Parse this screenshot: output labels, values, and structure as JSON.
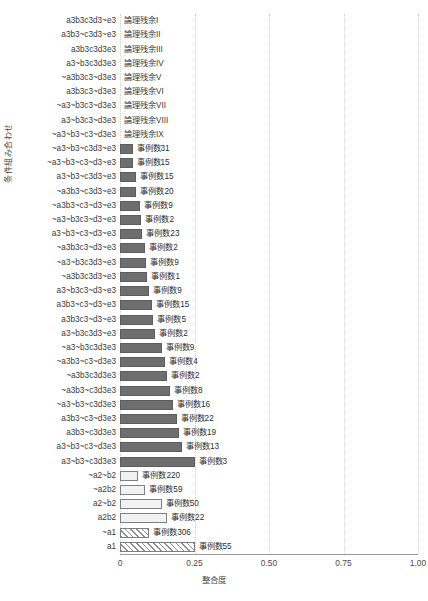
{
  "chart_data": {
    "type": "bar",
    "title": "",
    "xlabel": "整合度",
    "ylabel": "条件組み合わせ",
    "xlim": [
      0,
      1.0
    ],
    "xticks": [
      "0",
      "0.25",
      "0.50",
      "0.75",
      "1.00"
    ],
    "xtick_values": [
      0,
      0.25,
      0.5,
      0.75,
      1.0
    ],
    "grid": "vertical-dotted",
    "legend": "none",
    "orientation": "horizontal",
    "bar_styles": {
      "solid": "#6e6e6e",
      "hollow": "#f2f2f2",
      "hatch": "diagonal-stripes"
    },
    "categories": [
      "a3b3c3d3~e3",
      "a3b3~c3d3~e3",
      "a3b3c3d3e3",
      "a3~b3c3d3e3",
      "~a3b3c3~d3e3",
      "a3b3c3~d3e3",
      "~a3~b3c3~d3e3",
      "a3~b3c3~d3e3",
      "~a3~b3~c3~d3e3",
      "~a3~b3~c3d3~e3",
      "~a3~b3~c3~d3~e3",
      "a3~b3~c3d3~e3",
      "~a3b3~c3d3~e3",
      "~a3b3~c3~d3~e3",
      "~a3~b3c3~d3~e3",
      "a3~b3~c3~d3~e3",
      "~a3b3c3~d3~e3",
      "~a3~b3c3d3~e3",
      "~a3b3c3d3~e3",
      "a3~b3c3~d3~e3",
      "a3b3~c3~d3~e3",
      "a3b3c3~d3~e3",
      "a3~b3c3d3~e3",
      "~a3~b3c3d3e3",
      "~a3b3~c3~d3e3",
      "~a3b3c3d3e3",
      "~a3b3~c3d3e3",
      "~a3~b3~c3d3e3",
      "a3b3~c3~d3e3",
      "a3b3~c3d3e3",
      "a3~b3~c3~d3e3",
      "a3~b3~c3d3e3",
      "~a2~b2",
      "~a2b2",
      "a2~b2",
      "a2b2",
      "~a1",
      "a1"
    ],
    "values": [
      0,
      0,
      0,
      0,
      0,
      0,
      0,
      0,
      0,
      0.042,
      0.042,
      0.055,
      0.055,
      0.068,
      0.072,
      0.075,
      0.085,
      0.088,
      0.092,
      0.098,
      0.108,
      0.112,
      0.118,
      0.14,
      0.152,
      0.158,
      0.168,
      0.178,
      0.19,
      0.198,
      0.208,
      0.25,
      0.062,
      0.085,
      0.14,
      0.158,
      0.098,
      0.25
    ],
    "bar_labels": [
      "論理残余I",
      "論理残余II",
      "論理残余III",
      "論理残余IV",
      "論理残余V",
      "論理残余VI",
      "論理残余VII",
      "論理残余VIII",
      "論理残余IX",
      "事例数31",
      "事例数15",
      "事例数15",
      "事例数20",
      "事例数9",
      "事例数2",
      "事例数23",
      "事例数2",
      "事例数9",
      "事例数1",
      "事例数9",
      "事例数15",
      "事例数5",
      "事例数2",
      "事例数9",
      "事例数4",
      "事例数2",
      "事例数8",
      "事例数16",
      "事例数22",
      "事例数19",
      "事例数13",
      "事例数3",
      "事例数220",
      "事例数59",
      "事例数50",
      "事例数22",
      "事例数306",
      "事例数55"
    ],
    "bar_types": [
      "none",
      "none",
      "none",
      "none",
      "none",
      "none",
      "none",
      "none",
      "none",
      "solid",
      "solid",
      "solid",
      "solid",
      "solid",
      "solid",
      "solid",
      "solid",
      "solid",
      "solid",
      "solid",
      "solid",
      "solid",
      "solid",
      "solid",
      "solid",
      "solid",
      "solid",
      "solid",
      "solid",
      "solid",
      "solid",
      "solid",
      "hollow",
      "hollow",
      "hollow",
      "hollow",
      "hatch",
      "hatch"
    ]
  }
}
